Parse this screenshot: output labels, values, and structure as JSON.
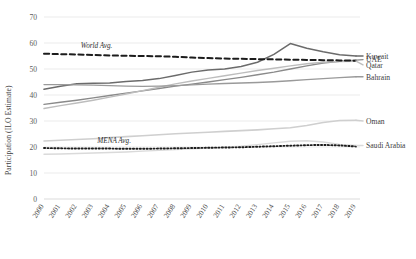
{
  "chart_data": {
    "type": "line",
    "title": "",
    "xlabel": "",
    "ylabel": "Participation (ILO Estimate)",
    "ylim": [
      0,
      70
    ],
    "yticks": [
      0,
      10,
      20,
      30,
      40,
      50,
      60,
      70
    ],
    "grid": "horizontal",
    "legend_position": "right-inline-labels",
    "x": [
      2000,
      2001,
      2002,
      2003,
      2004,
      2005,
      2006,
      2007,
      2008,
      2009,
      2010,
      2011,
      2012,
      2013,
      2014,
      2015,
      2016,
      2017,
      2018,
      2019
    ],
    "categories": [
      "2000",
      "2001",
      "2002",
      "2003",
      "2004",
      "2005",
      "2006",
      "2007",
      "2008",
      "2009",
      "2010",
      "2011",
      "2012",
      "2013",
      "2014",
      "2015",
      "2016",
      "2017",
      "2018",
      "2019"
    ],
    "series": [
      {
        "name": "Kuwait",
        "color": "#6b6b6b",
        "style": "solid",
        "width": 1.5,
        "label_y": 55.0,
        "values": [
          42.2,
          43.4,
          44.3,
          44.5,
          44.6,
          45.2,
          45.6,
          46.3,
          47.5,
          48.8,
          49.6,
          50.0,
          51.0,
          52.6,
          55.6,
          59.8,
          58.0,
          56.6,
          55.5,
          55.0
        ]
      },
      {
        "name": "UAE",
        "color": "#8a8a8a",
        "style": "solid",
        "width": 1.4,
        "label_y": 53.6,
        "values": [
          36.4,
          37.2,
          38.0,
          38.9,
          39.8,
          40.7,
          41.6,
          42.5,
          43.4,
          44.2,
          45.0,
          45.9,
          46.8,
          47.8,
          48.8,
          50.0,
          51.2,
          52.3,
          53.0,
          53.4
        ]
      },
      {
        "name": "Qatar",
        "color": "#bdbdbd",
        "style": "solid",
        "width": 1.4,
        "label_y": 51.6,
        "values": [
          34.8,
          35.9,
          36.9,
          38.0,
          39.2,
          40.4,
          41.7,
          43.0,
          44.3,
          45.4,
          46.4,
          47.4,
          48.4,
          49.4,
          50.3,
          51.2,
          52.0,
          52.6,
          52.9,
          53.0
        ]
      },
      {
        "name": "Bahrain",
        "color": "#9a9a9a",
        "style": "solid",
        "width": 1.4,
        "label_y": 47.0,
        "values": [
          44.0,
          44.0,
          43.9,
          43.8,
          43.6,
          43.4,
          43.3,
          43.4,
          43.6,
          43.9,
          44.2,
          44.4,
          44.6,
          44.8,
          45.1,
          45.5,
          45.9,
          46.3,
          46.7,
          47.0
        ]
      },
      {
        "name": "Oman",
        "color": "#cfcfcf",
        "style": "solid",
        "width": 1.6,
        "label_y": 30.0,
        "values": [
          22.3,
          22.6,
          22.9,
          23.2,
          23.6,
          24.0,
          24.3,
          24.7,
          25.1,
          25.4,
          25.7,
          26.0,
          26.3,
          26.6,
          27.0,
          27.4,
          28.3,
          29.4,
          30.2,
          30.3
        ]
      },
      {
        "name": "Saudi Arabia",
        "color": "#dadada",
        "style": "solid",
        "width": 1.4,
        "label_y": 20.6,
        "values": [
          17.2,
          17.3,
          17.5,
          17.7,
          17.9,
          18.1,
          18.4,
          18.7,
          19.0,
          19.3,
          19.6,
          19.9,
          20.3,
          20.9,
          21.6,
          22.2,
          22.4,
          21.9,
          21.0,
          20.6
        ]
      }
    ],
    "reference_lines": [
      {
        "name": "World Avg.",
        "color": "#1c1c1c",
        "style": "dashed",
        "width": 2.0,
        "annotation": "World Avg.",
        "values": [
          55.9,
          55.7,
          55.6,
          55.4,
          55.2,
          55.1,
          55.0,
          54.9,
          54.7,
          54.4,
          54.2,
          54.0,
          53.9,
          53.8,
          53.7,
          53.6,
          53.5,
          53.4,
          53.3,
          53.2
        ]
      },
      {
        "name": "MENA Avg.",
        "color": "#1c1c1c",
        "style": "dotted",
        "width": 1.9,
        "annotation": "MENA Avg.",
        "values": [
          19.6,
          19.5,
          19.4,
          19.4,
          19.4,
          19.3,
          19.3,
          19.4,
          19.5,
          19.6,
          19.7,
          19.8,
          19.9,
          20.1,
          20.3,
          20.5,
          20.7,
          20.8,
          20.6,
          20.2
        ]
      }
    ]
  }
}
